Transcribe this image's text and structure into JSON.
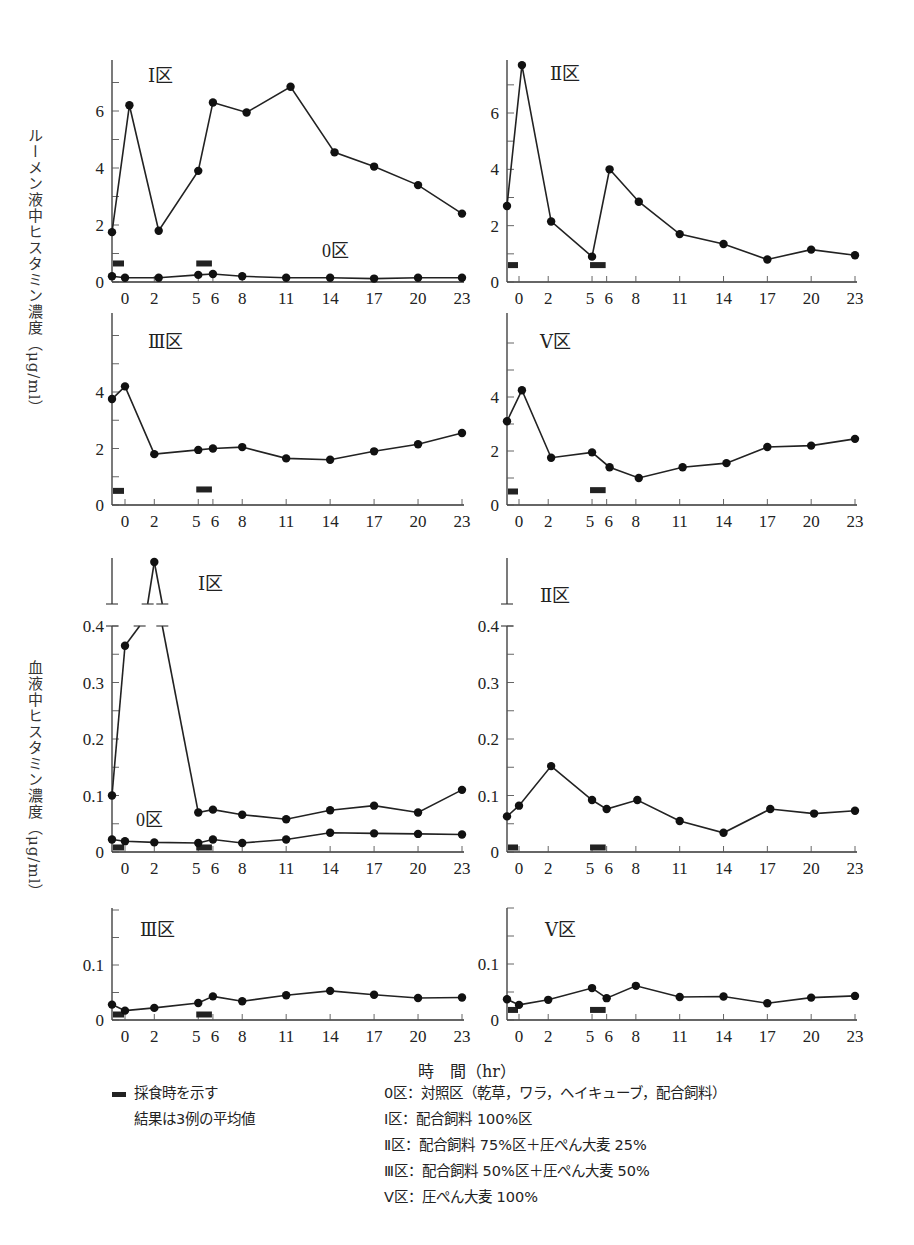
{
  "chart_data": [
    {
      "id": "rumen-I",
      "type": "line",
      "section": "rumen",
      "panel_label": "Ⅰ区",
      "secondary_label": "0区",
      "x_ticks": [
        0,
        2,
        5,
        6,
        8,
        11,
        14,
        17,
        20,
        23
      ],
      "y_ticks": [
        0,
        2,
        4,
        6
      ],
      "ylim": [
        0,
        7.6
      ],
      "series": [
        {
          "name": "Ⅰ区",
          "x": [
            -1,
            0.3,
            2.3,
            5,
            6,
            8.3,
            11.3,
            14.3,
            17,
            20,
            23
          ],
          "y": [
            1.75,
            6.2,
            1.8,
            3.9,
            6.3,
            5.95,
            6.85,
            4.55,
            4.05,
            3.4,
            2.4
          ]
        },
        {
          "name": "0区",
          "x": [
            -1,
            0,
            2.3,
            5,
            6,
            8,
            11,
            14,
            17,
            20,
            23
          ],
          "y": [
            0.2,
            0.15,
            0.15,
            0.25,
            0.28,
            0.2,
            0.15,
            0.15,
            0.12,
            0.15,
            0.15
          ]
        }
      ],
      "feeding_bars": [
        [
          -1,
          0,
          0.65
        ],
        [
          5,
          6,
          0.65
        ]
      ]
    },
    {
      "id": "rumen-II",
      "type": "line",
      "section": "rumen",
      "panel_label": "Ⅱ区",
      "x_ticks": [
        0,
        2,
        5,
        6,
        8,
        11,
        14,
        17,
        20,
        23
      ],
      "y_ticks": [
        0,
        2,
        4,
        6
      ],
      "ylim": [
        0,
        7.8
      ],
      "series": [
        {
          "name": "Ⅱ区",
          "x": [
            -1,
            0.2,
            2.2,
            5,
            6.2,
            8.2,
            11,
            14,
            17,
            20,
            23
          ],
          "y": [
            2.7,
            7.7,
            2.15,
            0.9,
            4.0,
            2.85,
            1.7,
            1.35,
            0.8,
            1.15,
            0.95
          ]
        }
      ],
      "feeding_bars": [
        [
          -1,
          0,
          0.6
        ],
        [
          5,
          6,
          0.6
        ]
      ]
    },
    {
      "id": "rumen-III",
      "type": "line",
      "section": "rumen",
      "panel_label": "Ⅲ区",
      "x_ticks": [
        0,
        2,
        5,
        6,
        8,
        11,
        14,
        17,
        20,
        23
      ],
      "y_ticks": [
        0,
        2,
        4
      ],
      "ylim": [
        0,
        6.8
      ],
      "series": [
        {
          "name": "Ⅲ区",
          "x": [
            -1,
            0,
            2,
            5,
            6,
            8,
            11,
            14,
            17,
            20,
            23
          ],
          "y": [
            3.75,
            4.2,
            1.8,
            1.95,
            2.0,
            2.05,
            1.65,
            1.6,
            1.9,
            2.15,
            2.55
          ]
        }
      ],
      "feeding_bars": [
        [
          -1,
          0,
          0.5
        ],
        [
          5,
          6,
          0.55
        ]
      ]
    },
    {
      "id": "rumen-V",
      "type": "line",
      "section": "rumen",
      "panel_label": "Ⅴ区",
      "x_ticks": [
        0,
        2,
        5,
        6,
        8,
        11,
        14,
        17,
        20,
        23
      ],
      "y_ticks": [
        0,
        2,
        4
      ],
      "ylim": [
        0,
        6.8
      ],
      "series": [
        {
          "name": "Ⅴ区",
          "x": [
            -1,
            0.2,
            2.2,
            5,
            6.2,
            8.2,
            11.2,
            14.2,
            17,
            20,
            23
          ],
          "y": [
            3.1,
            4.25,
            1.75,
            1.95,
            1.4,
            1.0,
            1.4,
            1.55,
            2.15,
            2.2,
            2.45
          ]
        }
      ],
      "feeding_bars": [
        [
          -1,
          0,
          0.5
        ],
        [
          5,
          6,
          0.55
        ]
      ]
    },
    {
      "id": "blood-I",
      "type": "line",
      "section": "blood",
      "panel_label": "Ⅰ区",
      "secondary_label": "0区",
      "axis_break": true,
      "x_ticks": [
        0,
        2,
        5,
        6,
        8,
        11,
        14,
        17,
        20,
        23
      ],
      "y_ticks": [
        0,
        0.1,
        0.2,
        0.3,
        0.4
      ],
      "ylim": [
        0,
        0.43
      ],
      "series": [
        {
          "name": "Ⅰ区",
          "x": [
            -1,
            0,
            2,
            5,
            6,
            8,
            11,
            14,
            17,
            20,
            23
          ],
          "y": [
            0.1,
            0.365,
            "off-scale peak (>0.43)",
            0.07,
            0.075,
            0.066,
            0.058,
            0.074,
            0.082,
            0.07,
            0.11
          ]
        },
        {
          "name": "0区",
          "x": [
            -1,
            0,
            2,
            5,
            6,
            8,
            11,
            14,
            17,
            20,
            23
          ],
          "y": [
            0.022,
            0.019,
            0.017,
            0.016,
            0.022,
            0.016,
            0.022,
            0.034,
            0.033,
            0.032,
            0.031
          ]
        }
      ],
      "feeding_bars": [
        [
          -1,
          0,
          0.008
        ],
        [
          5,
          6,
          0.008
        ]
      ]
    },
    {
      "id": "blood-II",
      "type": "line",
      "section": "blood",
      "panel_label": "Ⅱ区",
      "axis_break": true,
      "x_ticks": [
        0,
        2,
        5,
        6,
        8,
        11,
        14,
        17,
        20,
        23
      ],
      "y_ticks": [
        0,
        0.1,
        0.2,
        0.3,
        0.4
      ],
      "ylim": [
        0,
        0.43
      ],
      "series": [
        {
          "name": "Ⅱ区",
          "x": [
            -1,
            0,
            2.2,
            5,
            6,
            8.1,
            11,
            14,
            17.2,
            20.2,
            23
          ],
          "y": [
            0.063,
            0.082,
            0.152,
            0.092,
            0.076,
            0.092,
            0.055,
            0.034,
            0.076,
            0.068,
            0.073
          ]
        }
      ],
      "feeding_bars": [
        [
          -1,
          0,
          0.008
        ],
        [
          5,
          6,
          0.008
        ]
      ]
    },
    {
      "id": "blood-III",
      "type": "line",
      "section": "blood",
      "panel_label": "Ⅲ区",
      "x_ticks": [
        0,
        2,
        5,
        6,
        8,
        11,
        14,
        17,
        20,
        23
      ],
      "y_ticks": [
        0,
        0.1
      ],
      "ylim": [
        0,
        0.2
      ],
      "series": [
        {
          "name": "Ⅲ区",
          "x": [
            -1,
            0,
            2,
            5,
            6,
            8,
            11,
            14,
            17,
            20,
            23
          ],
          "y": [
            0.028,
            0.017,
            0.022,
            0.031,
            0.043,
            0.034,
            0.045,
            0.053,
            0.046,
            0.04,
            0.041
          ]
        }
      ],
      "feeding_bars": [
        [
          -1,
          0,
          0.01
        ],
        [
          5,
          6,
          0.01
        ]
      ]
    },
    {
      "id": "blood-V",
      "type": "line",
      "section": "blood",
      "panel_label": "Ⅴ区",
      "x_ticks": [
        0,
        2,
        5,
        6,
        8,
        11,
        14,
        17,
        20,
        23
      ],
      "y_ticks": [
        0,
        0.1
      ],
      "ylim": [
        0,
        0.2
      ],
      "series": [
        {
          "name": "Ⅴ区",
          "x": [
            -1,
            0,
            2,
            5,
            6,
            8,
            11,
            14,
            17,
            20,
            23
          ],
          "y": [
            0.037,
            0.027,
            0.036,
            0.057,
            0.039,
            0.061,
            0.041,
            0.042,
            0.03,
            0.04,
            0.043
          ]
        }
      ],
      "feeding_bars": [
        [
          -1,
          0,
          0.018
        ],
        [
          5,
          6,
          0.018
        ]
      ]
    }
  ],
  "labels": {
    "rumen_ylabel": "ルーメン液中ヒスタミン濃度（μg/ml）",
    "blood_ylabel": "血液中ヒスタミン濃度（μg/ml）",
    "xlabel": "時　間（hr）"
  },
  "legend": {
    "feeding_note": "採食時を示す",
    "average_note": "結果は3例の平均値",
    "groups": [
      "0区：対照区（乾草，ワラ，ヘイキューブ，配合飼料）",
      "Ⅰ区：配合飼料 100%区",
      "Ⅱ区：配合飼料 75%区＋圧ぺん大麦 25%",
      "Ⅲ区：配合飼料 50%区＋圧ぺん大麦 50%",
      "Ⅴ区：圧ぺん大麦 100%"
    ]
  }
}
